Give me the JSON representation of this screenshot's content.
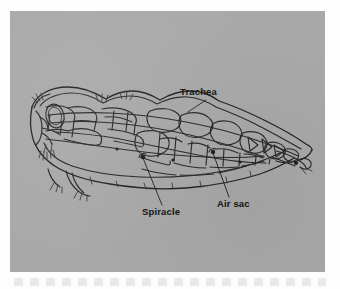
{
  "figure": {
    "kind": "scientific-illustration",
    "view": "lateral-cutaway",
    "plate": {
      "background_color": "#a9a9a9",
      "page_color": "#fdfdfd",
      "ink_color": "#2a2a2a",
      "x": 10,
      "y": 11,
      "width": 315,
      "height": 261
    },
    "callouts": [
      {
        "id": "trachea",
        "label": "Trachea",
        "label_x": 170,
        "label_y": 75,
        "leader_from": [
          196,
          89
        ],
        "leader_to": [
          178,
          101
        ]
      },
      {
        "id": "spiracle",
        "label": "Spiracle",
        "label_x": 132,
        "label_y": 195,
        "leader_from": [
          152,
          194
        ],
        "leader_to": [
          133,
          146
        ]
      },
      {
        "id": "air-sac",
        "label": "Air sac",
        "label_x": 207,
        "label_y": 187,
        "leader_from": [
          219,
          186
        ],
        "leader_to": [
          203,
          141
        ]
      }
    ]
  }
}
